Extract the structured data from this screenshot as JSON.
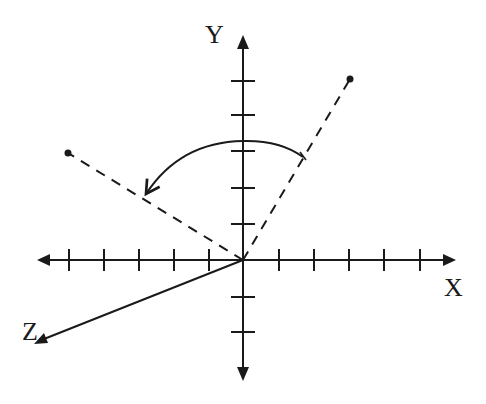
{
  "diagram": {
    "colors": {
      "stroke": "#1a1a1a",
      "background": "#ffffff"
    },
    "axes": {
      "x_label": "X",
      "y_label": "Y",
      "z_label": "Z",
      "origin": [
        243,
        260
      ],
      "x_ticks_left": [
        69,
        104,
        139,
        174,
        209
      ],
      "x_ticks_right": [
        279,
        314,
        349,
        384,
        420
      ],
      "y_ticks_up": [
        81,
        115,
        151,
        188,
        224
      ],
      "y_ticks_down": [
        297,
        332
      ]
    },
    "vectors": [
      {
        "name": "initial-vector",
        "style": "dashed",
        "end": [
          350,
          79
        ]
      },
      {
        "name": "rotated-vector",
        "style": "dashed",
        "end": [
          68,
          153
        ]
      }
    ],
    "rotation_arc": {
      "direction": "counter-clockwise",
      "from": [
        303,
        157
      ],
      "to": [
        144,
        196
      ]
    }
  }
}
